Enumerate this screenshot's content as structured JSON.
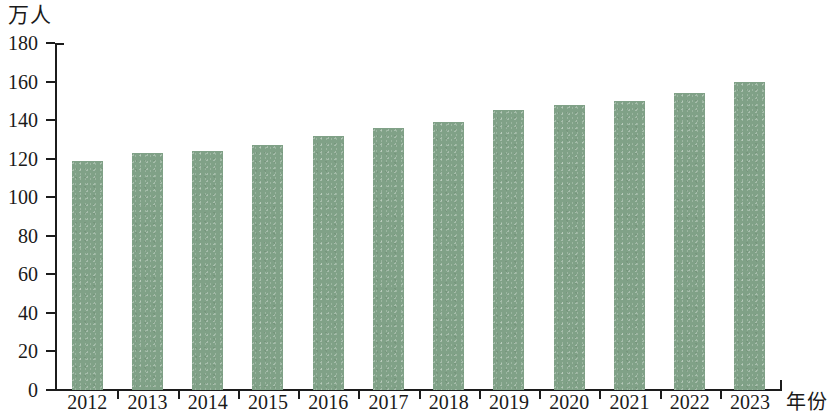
{
  "chart_data": {
    "type": "bar",
    "title": "",
    "xlabel": "年份",
    "ylabel": "万人",
    "categories": [
      "2012",
      "2013",
      "2014",
      "2015",
      "2016",
      "2017",
      "2018",
      "2019",
      "2020",
      "2021",
      "2022",
      "2023"
    ],
    "values": [
      119,
      123,
      124,
      127,
      132,
      136,
      139,
      145,
      148,
      150,
      154,
      160
    ],
    "ylim": [
      0,
      180
    ],
    "ytick_labels": [
      "180",
      "160",
      "140",
      "120",
      "100",
      "80",
      "60",
      "40",
      "20",
      "0"
    ],
    "ytick_values": [
      180,
      160,
      140,
      120,
      100,
      80,
      60,
      40,
      20,
      0
    ],
    "grid": false,
    "legend": false,
    "bar_color": "#80a187",
    "axis_color": "#1c1c1c",
    "background_color": "#ffffff"
  },
  "axis": {
    "y_unit_caption": "万人",
    "x_axis_caption": "年份"
  }
}
